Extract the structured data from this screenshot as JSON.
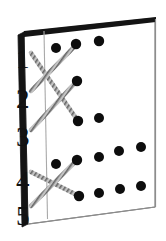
{
  "figure": {
    "background_color": "#ffffff",
    "ink_color": "#111111",
    "dot_color": "#0d0d0d",
    "spine_color": "#141414",
    "edge_color": "#6e6e6e",
    "thread_color": "#8a8a8a",
    "thread_highlight": "#f2f2f2"
  },
  "board": {
    "name": "tilted-rectangular-panel",
    "outline": [
      {
        "x": 24,
        "y": 32
      },
      {
        "x": 155,
        "y": 18
      },
      {
        "x": 155,
        "y": 207
      },
      {
        "x": 28,
        "y": 224
      }
    ],
    "spine": [
      {
        "x": 18,
        "y": 35
      },
      {
        "x": 24,
        "y": 32
      },
      {
        "x": 28,
        "y": 224
      },
      {
        "x": 22,
        "y": 227
      }
    ],
    "top_bevel": [
      {
        "x": 24,
        "y": 32
      },
      {
        "x": 155,
        "y": 18
      },
      {
        "x": 155,
        "y": 22
      },
      {
        "x": 24,
        "y": 37
      }
    ],
    "margin_rule": {
      "name": "vertical-margin-line",
      "x1": 44,
      "y1": 31,
      "x2": 47,
      "y2": 218
    }
  },
  "row_labels": [
    {
      "text": "1",
      "x": 16,
      "y": 46
    },
    {
      "text": "2",
      "x": 16,
      "y": 86
    },
    {
      "text": "3",
      "x": 16,
      "y": 124
    },
    {
      "text": "4",
      "x": 16,
      "y": 168
    },
    {
      "text": "5",
      "x": 16,
      "y": 203
    }
  ],
  "dots": {
    "radius": 5.0,
    "points": [
      {
        "id": "d1",
        "x": 56,
        "y": 48
      },
      {
        "id": "d2",
        "x": 76,
        "y": 44
      },
      {
        "id": "d3",
        "x": 99,
        "y": 41
      },
      {
        "id": "d4",
        "x": 77,
        "y": 81
      },
      {
        "id": "d5",
        "x": 78,
        "y": 121
      },
      {
        "id": "d6",
        "x": 99,
        "y": 118
      },
      {
        "id": "d7",
        "x": 99,
        "y": 157
      },
      {
        "id": "d8",
        "x": 119,
        "y": 151
      },
      {
        "id": "d9",
        "x": 141,
        "y": 147
      },
      {
        "id": "d10",
        "x": 56,
        "y": 164
      },
      {
        "id": "d11",
        "x": 77,
        "y": 160
      },
      {
        "id": "d12",
        "x": 79,
        "y": 196
      },
      {
        "id": "d13",
        "x": 99,
        "y": 193
      },
      {
        "id": "d14",
        "x": 120,
        "y": 189
      },
      {
        "id": "d15",
        "x": 141,
        "y": 186
      }
    ]
  },
  "threads": [
    {
      "id": "t1",
      "label": "thread-from-row-1",
      "x1": 31,
      "y1": 53,
      "x2": 78,
      "y2": 121
    },
    {
      "id": "t2",
      "label": "thread-from-row-2",
      "x1": 31,
      "y1": 91,
      "x2": 77,
      "y2": 44
    },
    {
      "id": "t3",
      "label": "thread-to-row-3",
      "x1": 31,
      "y1": 130,
      "x2": 77,
      "y2": 81
    },
    {
      "id": "t4",
      "label": "thread-from-row-4",
      "x1": 31,
      "y1": 172,
      "x2": 79,
      "y2": 196
    },
    {
      "id": "t5",
      "label": "thread-from-row-5",
      "x1": 31,
      "y1": 206,
      "x2": 77,
      "y2": 160
    }
  ]
}
